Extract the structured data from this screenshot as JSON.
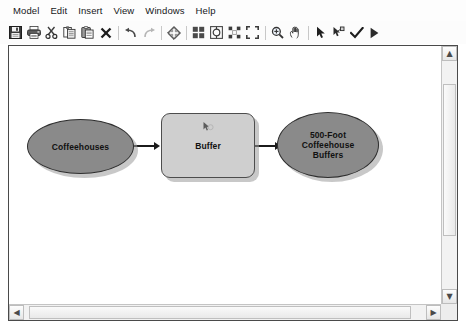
{
  "menu": {
    "items": [
      {
        "name": "model",
        "label": "Model"
      },
      {
        "name": "edit",
        "label": "Edit"
      },
      {
        "name": "insert",
        "label": "Insert"
      },
      {
        "name": "view",
        "label": "View"
      },
      {
        "name": "windows",
        "label": "Windows"
      },
      {
        "name": "help",
        "label": "Help"
      }
    ]
  },
  "toolbar": {
    "buttons": [
      {
        "name": "save-button",
        "icon": "save-icon",
        "title": "Save"
      },
      {
        "name": "print-button",
        "icon": "print-icon",
        "title": "Print"
      },
      {
        "name": "cut-button",
        "icon": "scissors-icon",
        "title": "Cut"
      },
      {
        "name": "copy-button",
        "icon": "copy-icon",
        "title": "Copy"
      },
      {
        "name": "paste-button",
        "icon": "paste-icon",
        "title": "Paste"
      },
      {
        "name": "delete-button",
        "icon": "close-x-icon",
        "title": "Delete"
      },
      {
        "name": "undo-button",
        "icon": "undo-arrow-icon",
        "title": "Undo"
      },
      {
        "name": "redo-button",
        "icon": "redo-arrow-icon",
        "title": "Redo"
      },
      {
        "name": "add-data-button",
        "icon": "diamond-plus-icon",
        "title": "Add Data or Tool"
      },
      {
        "name": "auto-layout-button",
        "icon": "grid-squares-icon",
        "title": "Auto Layout"
      },
      {
        "name": "diagram-properties-button",
        "icon": "diagram-gear-icon",
        "title": "Diagram Properties"
      },
      {
        "name": "full-extent-button",
        "icon": "full-extent-icon",
        "title": "Full Extent"
      },
      {
        "name": "zoom-to-selected-button",
        "icon": "zoom-selected-icon",
        "title": "Zoom To Selected"
      },
      {
        "name": "zoom-in-button",
        "icon": "magnifier-icon",
        "title": "Zoom In"
      },
      {
        "name": "pan-button",
        "icon": "hand-icon",
        "title": "Pan"
      },
      {
        "name": "select-button",
        "icon": "cursor-arrow-icon",
        "title": "Select"
      },
      {
        "name": "connect-button",
        "icon": "connect-icon",
        "title": "Connect"
      },
      {
        "name": "validate-button",
        "icon": "checkmark-icon",
        "title": "Validate Entire Model"
      },
      {
        "name": "run-button",
        "icon": "play-triangle-icon",
        "title": "Run"
      }
    ]
  },
  "model": {
    "nodes": [
      {
        "name": "input-data-node",
        "label": "Coffeehouses",
        "shape": "ellipse",
        "fill": "#8a8a8a",
        "stroke": "#2e2e2e",
        "x": 18,
        "y": 73,
        "w": 107,
        "h": 55
      },
      {
        "name": "tool-node",
        "label": "Buffer",
        "shape": "rounded-rect",
        "fill": "#cfcfcf",
        "stroke": "#4d4d4d",
        "x": 152,
        "y": 67,
        "w": 94,
        "h": 65
      },
      {
        "name": "output-data-node",
        "label": "500-Foot\nCoffeehouse\nBuffers",
        "shape": "ellipse",
        "fill": "#8a8a8a",
        "stroke": "#2e2e2e",
        "x": 268,
        "y": 66,
        "w": 102,
        "h": 66
      }
    ],
    "connectors": [
      {
        "name": "connector-input-to-tool",
        "from": "input-data-node",
        "to": "tool-node",
        "x": 126,
        "y": 99,
        "length": 25
      },
      {
        "name": "connector-tool-to-output",
        "from": "tool-node",
        "to": "output-data-node",
        "x": 247,
        "y": 99,
        "length": 22
      }
    ],
    "tool_marker": {
      "name": "tool-cursor-marker-icon",
      "x": 193,
      "y": 75
    }
  },
  "scrollbars": {
    "vertical": {
      "name": "vertical-scrollbar",
      "up_glyph": "▲",
      "down_glyph": "▼",
      "thumb_top": 38,
      "thumb_height": 152
    },
    "horizontal": {
      "name": "horizontal-scrollbar",
      "left_glyph": "◀",
      "right_glyph": "▶",
      "thumb_left": 20,
      "thumb_width": 382
    }
  },
  "colors": {
    "canvas_bg": "#ffffff",
    "data_node_fill": "#8a8a8a",
    "tool_node_fill": "#cfcfcf",
    "connector": "#1b1b1b",
    "frame_border": "#4a4a4a"
  }
}
